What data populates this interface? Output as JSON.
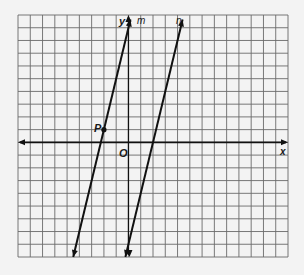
{
  "diagram": {
    "type": "coordinate-plane",
    "grid": {
      "x_min": -9,
      "x_max": 13,
      "y_min": -9,
      "y_max": 10,
      "grid_color": "#6a6a6a",
      "axis_color": "#111111"
    },
    "axes": {
      "x_label": "x",
      "y_label": "y",
      "origin_label": "O"
    },
    "lines": [
      {
        "name": "m",
        "label": "m",
        "slope": 4,
        "intercept": 9,
        "color": "#111111"
      },
      {
        "name": "n",
        "label": "n",
        "slope": 4,
        "intercept": -8,
        "color": "#111111"
      }
    ],
    "points": [
      {
        "label": "P",
        "x": -2,
        "y": 1
      }
    ]
  }
}
